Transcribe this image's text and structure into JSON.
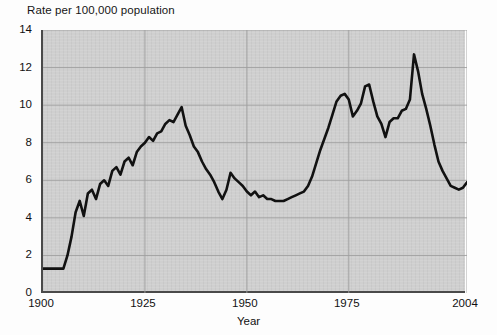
{
  "chart_data": {
    "type": "line",
    "title": "Rate per 100,000 population",
    "subtitle": "",
    "xlabel": "Year",
    "ylabel": "",
    "xlim": [
      1900,
      2004
    ],
    "ylim": [
      0,
      14
    ],
    "xticks": [
      1900,
      1925,
      1950,
      1975,
      2004
    ],
    "xticklabels": [
      "1900",
      "1925",
      "1950",
      "1975",
      "2004"
    ],
    "yticks": [
      0,
      2,
      4,
      6,
      8,
      10,
      12,
      14
    ],
    "yticklabels": [
      "0",
      "2",
      "4",
      "6",
      "8",
      "10",
      "12",
      "14"
    ],
    "grid": true,
    "grid_axis": "both",
    "legend": false,
    "legend_position": "none",
    "line_color": "#111111",
    "line_width": 2.6,
    "plot_background": "#cdcdcd",
    "figure_background": "#fdfdfd",
    "axis_color": "#4a4a4a",
    "series": [
      {
        "name": "Rate per 100,000 population",
        "x": [
          1900,
          1901,
          1902,
          1903,
          1904,
          1905,
          1906,
          1907,
          1908,
          1909,
          1910,
          1911,
          1912,
          1913,
          1914,
          1915,
          1916,
          1917,
          1918,
          1919,
          1920,
          1921,
          1922,
          1923,
          1924,
          1925,
          1926,
          1927,
          1928,
          1929,
          1930,
          1931,
          1932,
          1933,
          1934,
          1935,
          1936,
          1937,
          1938,
          1939,
          1940,
          1941,
          1942,
          1943,
          1944,
          1945,
          1946,
          1947,
          1948,
          1949,
          1950,
          1951,
          1952,
          1953,
          1954,
          1955,
          1956,
          1957,
          1958,
          1959,
          1960,
          1961,
          1962,
          1963,
          1964,
          1965,
          1966,
          1967,
          1968,
          1969,
          1970,
          1971,
          1972,
          1973,
          1974,
          1975,
          1976,
          1977,
          1978,
          1979,
          1980,
          1981,
          1982,
          1983,
          1984,
          1985,
          1986,
          1987,
          1988,
          1989,
          1990,
          1991,
          1992,
          1993,
          1994,
          1995,
          1996,
          1997,
          1998,
          1999,
          2000,
          2001,
          2002,
          2003,
          2004
        ],
        "values": [
          1.3,
          1.3,
          1.3,
          1.3,
          1.3,
          1.3,
          2.0,
          3.0,
          4.3,
          4.9,
          4.1,
          5.3,
          5.5,
          5.0,
          5.8,
          6.0,
          5.7,
          6.5,
          6.7,
          6.3,
          7.0,
          7.2,
          6.8,
          7.5,
          7.8,
          8.0,
          8.3,
          8.1,
          8.5,
          8.6,
          9.0,
          9.2,
          9.1,
          9.5,
          9.9,
          8.9,
          8.4,
          7.8,
          7.5,
          7.0,
          6.6,
          6.3,
          5.9,
          5.4,
          5.0,
          5.5,
          6.4,
          6.1,
          5.9,
          5.7,
          5.4,
          5.2,
          5.4,
          5.1,
          5.2,
          5.0,
          5.0,
          4.9,
          4.9,
          4.9,
          5.0,
          5.1,
          5.2,
          5.3,
          5.4,
          5.7,
          6.2,
          6.9,
          7.6,
          8.2,
          8.8,
          9.5,
          10.2,
          10.5,
          10.6,
          10.3,
          9.4,
          9.7,
          10.1,
          11.0,
          11.1,
          10.2,
          9.4,
          9.0,
          8.3,
          9.1,
          9.3,
          9.3,
          9.7,
          9.8,
          10.3,
          12.7,
          11.8,
          10.6,
          9.8,
          8.9,
          7.9,
          7.0,
          6.5,
          6.1,
          5.7,
          5.6,
          5.5,
          5.6,
          5.9
        ]
      }
    ],
    "annotations": []
  }
}
